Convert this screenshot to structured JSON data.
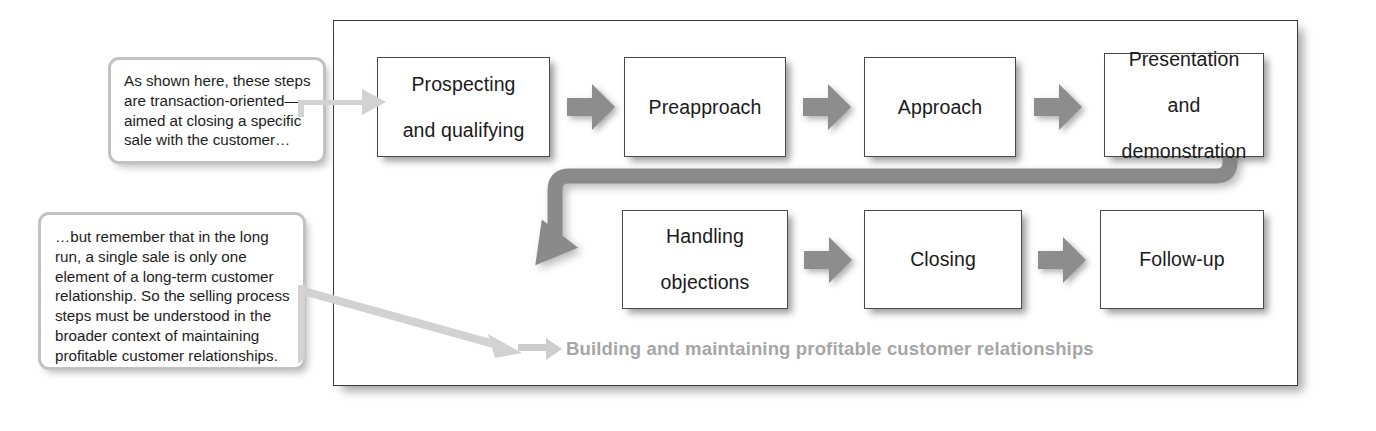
{
  "diagram": {
    "frame_caption": "Building and maintaining profitable customer relationships",
    "colors": {
      "box_fill": "#ffffff",
      "box_border": "#4a4a4a",
      "arrow_gray": "#8d8d8d",
      "connector_gray": "#8a8a8a",
      "caption_gray": "#a6a6a6",
      "callout_border": "#c2c2c2",
      "pointer_gray": "#cfcfcf",
      "frame_border": "#3a3a3a",
      "text": "#1a1a1a"
    },
    "rows": [
      {
        "name": "row-1",
        "steps": [
          {
            "id": "prospecting",
            "lines": [
              "Prospecting",
              "and qualifying"
            ]
          },
          {
            "id": "preapproach",
            "lines": [
              "Preapproach"
            ]
          },
          {
            "id": "approach",
            "lines": [
              "Approach"
            ]
          },
          {
            "id": "presentation",
            "lines": [
              "Presentation",
              "and",
              "demonstration"
            ]
          }
        ]
      },
      {
        "name": "row-2",
        "steps": [
          {
            "id": "handling-objections",
            "lines": [
              "Handling",
              "objections"
            ]
          },
          {
            "id": "closing",
            "lines": [
              "Closing"
            ]
          },
          {
            "id": "follow-up",
            "lines": [
              "Follow-up"
            ]
          }
        ]
      }
    ],
    "connectors": [
      {
        "id": "arrow-prospecting-to-preapproach",
        "type": "chevron-right"
      },
      {
        "id": "arrow-preapproach-to-approach",
        "type": "chevron-right"
      },
      {
        "id": "arrow-approach-to-presentation",
        "type": "chevron-right"
      },
      {
        "id": "arrow-presentation-to-handling",
        "type": "wrap-down-left"
      },
      {
        "id": "arrow-handling-to-closing",
        "type": "chevron-right"
      },
      {
        "id": "arrow-closing-to-followup",
        "type": "chevron-right"
      }
    ]
  },
  "callouts": [
    {
      "id": "callout-transaction",
      "text": "As shown here, these steps are transaction-oriented—aimed at closing a specific sale with the customer…",
      "pointer": "arrow-right"
    },
    {
      "id": "callout-relationship",
      "text": "…but remember that in the long run, a single sale is only one element of a long-term customer relationship. So the selling process steps must be understood in the broader context of maintaining profitable customer relationships.",
      "pointer": "arrow-diagonal-down-right"
    }
  ]
}
